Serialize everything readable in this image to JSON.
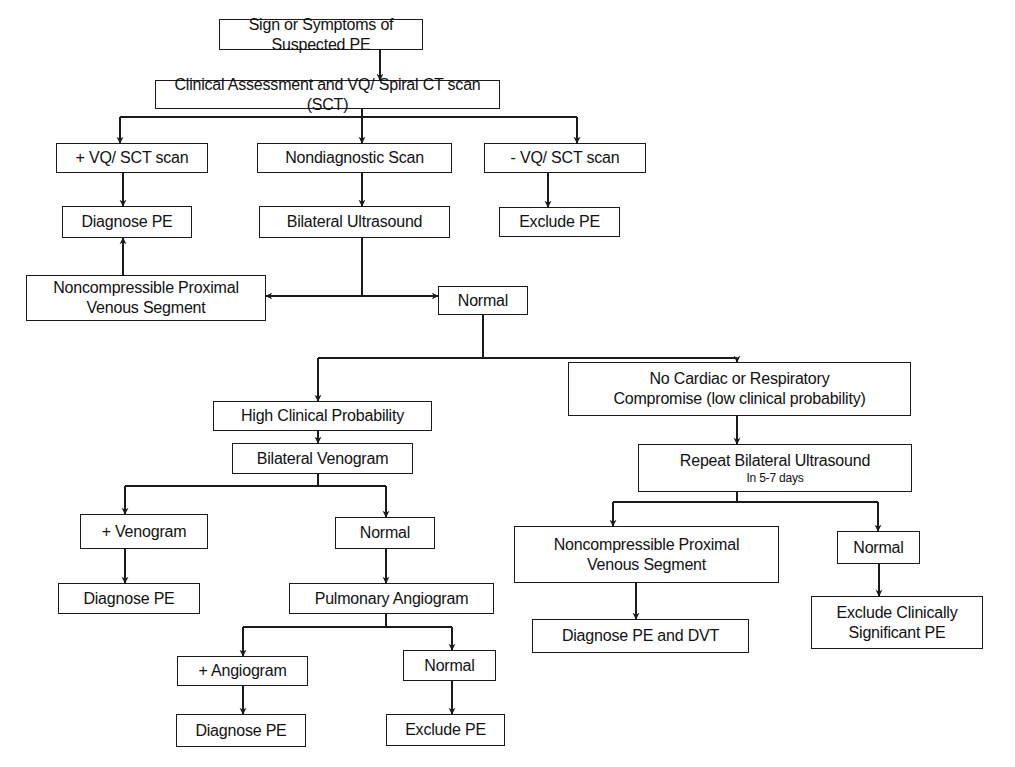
{
  "diagram": {
    "stroke_color": "#1a1a1a",
    "nodes": [
      {
        "id": "n1",
        "x": 219,
        "y": 19,
        "w": 204,
        "h": 31,
        "lines": [
          "Sign or Symptoms of Suspected PE"
        ]
      },
      {
        "id": "n2",
        "x": 155,
        "y": 80,
        "w": 345,
        "h": 29,
        "lines": [
          "Clinical Assessment and VQ/ Spiral CT scan (SCT)"
        ]
      },
      {
        "id": "n3",
        "x": 56,
        "y": 143,
        "w": 152,
        "h": 30,
        "lines": [
          "+ VQ/ SCT scan"
        ]
      },
      {
        "id": "n4",
        "x": 257,
        "y": 143,
        "w": 195,
        "h": 30,
        "lines": [
          "Nondiagnostic Scan"
        ]
      },
      {
        "id": "n5",
        "x": 484,
        "y": 143,
        "w": 162,
        "h": 30,
        "lines": [
          "- VQ/ SCT scan"
        ]
      },
      {
        "id": "n6",
        "x": 62,
        "y": 206,
        "w": 130,
        "h": 32,
        "lines": [
          "Diagnose PE"
        ]
      },
      {
        "id": "n7",
        "x": 259,
        "y": 206,
        "w": 191,
        "h": 32,
        "lines": [
          "Bilateral Ultrasound"
        ]
      },
      {
        "id": "n8",
        "x": 499,
        "y": 207,
        "w": 121,
        "h": 30,
        "lines": [
          "Exclude PE"
        ]
      },
      {
        "id": "n9",
        "x": 26,
        "y": 275,
        "w": 240,
        "h": 46,
        "lines": [
          "Noncompressible Proximal",
          "Venous Segment"
        ]
      },
      {
        "id": "n10",
        "x": 438,
        "y": 286,
        "w": 90,
        "h": 29,
        "lines": [
          "Normal"
        ]
      },
      {
        "id": "n11",
        "x": 213,
        "y": 401,
        "w": 219,
        "h": 30,
        "lines": [
          "High Clinical Probability"
        ]
      },
      {
        "id": "n12",
        "x": 568,
        "y": 362,
        "w": 343,
        "h": 54,
        "lines": [
          "No Cardiac or Respiratory",
          "Compromise (low clinical probability)"
        ]
      },
      {
        "id": "n13",
        "x": 232,
        "y": 443,
        "w": 181,
        "h": 31,
        "lines": [
          "Bilateral Venogram"
        ]
      },
      {
        "id": "n14",
        "x": 638,
        "y": 444,
        "w": 274,
        "h": 48,
        "lines": [
          "Repeat Bilateral Ultrasound"
        ],
        "sub": "In 5-7 days"
      },
      {
        "id": "n15",
        "x": 80,
        "y": 514,
        "w": 128,
        "h": 35,
        "lines": [
          "+ Venogram"
        ]
      },
      {
        "id": "n16",
        "x": 335,
        "y": 517,
        "w": 100,
        "h": 32,
        "lines": [
          "Normal"
        ]
      },
      {
        "id": "n17",
        "x": 514,
        "y": 526,
        "w": 265,
        "h": 57,
        "lines": [
          "Noncompressible Proximal",
          "Venous Segment"
        ]
      },
      {
        "id": "n18",
        "x": 837,
        "y": 531,
        "w": 83,
        "h": 33,
        "lines": [
          "Normal"
        ]
      },
      {
        "id": "n19",
        "x": 58,
        "y": 583,
        "w": 142,
        "h": 31,
        "lines": [
          "Diagnose PE"
        ]
      },
      {
        "id": "n20",
        "x": 289,
        "y": 583,
        "w": 205,
        "h": 31,
        "lines": [
          "Pulmonary Angiogram"
        ]
      },
      {
        "id": "n21",
        "x": 532,
        "y": 619,
        "w": 217,
        "h": 34,
        "lines": [
          "Diagnose PE and DVT"
        ]
      },
      {
        "id": "n22",
        "x": 811,
        "y": 596,
        "w": 172,
        "h": 53,
        "lines": [
          "Exclude Clinically",
          "Significant PE"
        ]
      },
      {
        "id": "n23",
        "x": 177,
        "y": 656,
        "w": 131,
        "h": 30,
        "lines": [
          "+ Angiogram"
        ]
      },
      {
        "id": "n24",
        "x": 403,
        "y": 650,
        "w": 93,
        "h": 31,
        "lines": [
          "Normal"
        ]
      },
      {
        "id": "n25",
        "x": 176,
        "y": 714,
        "w": 130,
        "h": 33,
        "lines": [
          "Diagnose PE"
        ]
      },
      {
        "id": "n26",
        "x": 386,
        "y": 714,
        "w": 119,
        "h": 32,
        "lines": [
          "Exclude PE"
        ]
      }
    ],
    "lines": [
      [
        [
          362,
          109
        ],
        [
          362,
          116
        ]
      ],
      [
        [
          120,
          117
        ],
        [
          577,
          117
        ]
      ],
      [
        [
          362,
          260
        ],
        [
          362,
          296
        ]
      ],
      [
        [
          483,
          315
        ],
        [
          483,
          358
        ]
      ],
      [
        [
          318,
          358
        ],
        [
          737,
          358
        ]
      ],
      [
        [
          318,
          474
        ],
        [
          318,
          486
        ]
      ],
      [
        [
          125,
          486
        ],
        [
          386,
          486
        ]
      ],
      [
        [
          737,
          492
        ],
        [
          737,
          502
        ]
      ],
      [
        [
          613,
          502
        ],
        [
          878,
          502
        ]
      ],
      [
        [
          386,
          614
        ],
        [
          386,
          627
        ]
      ],
      [
        [
          243,
          627
        ],
        [
          452,
          627
        ]
      ],
      [
        [
          362,
          238
        ],
        [
          362,
          260
        ]
      ]
    ],
    "arrows": [
      [
        [
          380,
          50
        ],
        [
          380,
          80
        ]
      ],
      [
        [
          120,
          117
        ],
        [
          120,
          143
        ]
      ],
      [
        [
          362,
          116
        ],
        [
          362,
          143
        ]
      ],
      [
        [
          577,
          117
        ],
        [
          577,
          143
        ]
      ],
      [
        [
          123,
          173
        ],
        [
          123,
          206
        ]
      ],
      [
        [
          362,
          173
        ],
        [
          362,
          206
        ]
      ],
      [
        [
          548,
          173
        ],
        [
          548,
          207
        ]
      ],
      [
        [
          123,
          275
        ],
        [
          123,
          238
        ]
      ],
      [
        [
          362,
          296
        ],
        [
          266,
          296
        ]
      ],
      [
        [
          362,
          296
        ],
        [
          438,
          296
        ]
      ],
      [
        [
          318,
          358
        ],
        [
          318,
          401
        ]
      ],
      [
        [
          737,
          358
        ],
        [
          737,
          362
        ]
      ],
      [
        [
          318,
          431
        ],
        [
          318,
          443
        ]
      ],
      [
        [
          737,
          416
        ],
        [
          737,
          444
        ]
      ],
      [
        [
          125,
          486
        ],
        [
          125,
          514
        ]
      ],
      [
        [
          386,
          486
        ],
        [
          386,
          517
        ]
      ],
      [
        [
          613,
          502
        ],
        [
          613,
          526
        ]
      ],
      [
        [
          878,
          502
        ],
        [
          878,
          531
        ]
      ],
      [
        [
          125,
          549
        ],
        [
          125,
          583
        ]
      ],
      [
        [
          386,
          549
        ],
        [
          386,
          583
        ]
      ],
      [
        [
          636,
          583
        ],
        [
          636,
          619
        ]
      ],
      [
        [
          879,
          564
        ],
        [
          879,
          596
        ]
      ],
      [
        [
          243,
          627
        ],
        [
          243,
          656
        ]
      ],
      [
        [
          452,
          627
        ],
        [
          452,
          650
        ]
      ],
      [
        [
          243,
          686
        ],
        [
          243,
          714
        ]
      ],
      [
        [
          452,
          681
        ],
        [
          452,
          714
        ]
      ]
    ]
  }
}
